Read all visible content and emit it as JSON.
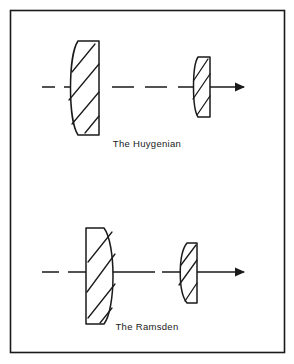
{
  "figure": {
    "border_color": "#1a1a1a",
    "background_color": "#ffffff",
    "ink_color": "#1a1a1a"
  },
  "diagrams": [
    {
      "id": "huygenian",
      "label": "The Huygenian",
      "axis": {
        "style": "dashed",
        "arrowhead": "right",
        "direction_label": "light-path-right"
      },
      "lenses": [
        {
          "name": "field-lens",
          "role": "field lens",
          "curvature": "plano-convex",
          "convex_side": "left",
          "flat_side": "right",
          "hatched": true
        },
        {
          "name": "eye-lens",
          "role": "eye lens",
          "curvature": "plano-convex",
          "convex_side": "left",
          "flat_side": "right",
          "hatched": true
        }
      ]
    },
    {
      "id": "ramsden",
      "label": "The Ramsden",
      "axis": {
        "style": "dashed",
        "arrowhead": "right",
        "direction_label": "light-path-right"
      },
      "lenses": [
        {
          "name": "field-lens",
          "role": "field lens",
          "curvature": "plano-convex",
          "convex_side": "right",
          "flat_side": "left",
          "hatched": true
        },
        {
          "name": "eye-lens",
          "role": "eye lens",
          "curvature": "plano-convex",
          "convex_side": "left",
          "flat_side": "right",
          "hatched": true
        }
      ]
    }
  ]
}
